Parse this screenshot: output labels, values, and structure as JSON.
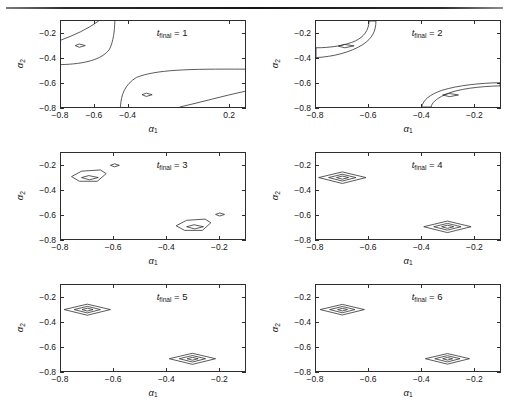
{
  "figure": {
    "kind": "contour-plot-grid",
    "rows": 3,
    "cols": 2,
    "background": "#ffffff",
    "line_color": "#2e2e2e",
    "rule_color": "#161616"
  },
  "axis": {
    "xlabel": "α",
    "xlabel_sub": "1",
    "ylabel": "α",
    "ylabel_sub": "2",
    "ylim": [
      -0.8,
      -0.1
    ],
    "yticks": [
      -0.2,
      -0.4,
      -0.6,
      -0.8
    ],
    "yticklabels": [
      "-0.2",
      "-0.4",
      "-0.6",
      "-0.8"
    ],
    "grid": false
  },
  "tag": {
    "symbol": "t",
    "subscript": "final",
    "equals": " = "
  },
  "chart_data": [
    {
      "type": "contour",
      "id": "panel-1",
      "title": "t_final = 1",
      "tag_value": "1",
      "xlabel": "α₁",
      "ylabel": "α₂",
      "xlim": [
        -0.8,
        0.3
      ],
      "ylim": [
        -0.8,
        -0.1
      ],
      "xticks": [
        -0.8,
        -0.6,
        -0.4,
        0.2
      ],
      "xticklabels": [
        "-0.8",
        "-0.6",
        "-0.4",
        "0.2"
      ],
      "yticks": [
        -0.2,
        -0.4,
        -0.6,
        -0.8
      ],
      "yticklabels": [
        "-0.2",
        "-0.4",
        "-0.6",
        "-0.8"
      ],
      "minima": [
        [
          -0.7,
          -0.3
        ],
        [
          -0.3,
          -0.7
        ]
      ],
      "description": "Two tiny closed diamond minima plus broad open contours sweeping across the panel; level sets are poorly localized.",
      "contour_paths": [
        "M -0.80 -0.255 C -0.72 -0.215 -0.64 -0.165 -0.575 -0.100",
        "M -0.80 -0.455 C -0.66 -0.450 -0.555 -0.415 -0.510 -0.330 C -0.486 -0.262 -0.480 -0.180 -0.478 -0.100",
        "M -0.445 -0.800 C -0.440 -0.700 -0.420 -0.620 -0.350 -0.560 C -0.230 -0.495 -0.040 -0.490 0.300 -0.492",
        "M -0.090 -0.800 C 0.040 -0.760 0.170 -0.710 0.300 -0.672",
        "M -0.715 -0.300 L -0.690 -0.287 L -0.655 -0.300 L -0.690 -0.314 Z",
        "M -0.315 -0.700 L -0.290 -0.687 L -0.255 -0.700 L -0.290 -0.714 Z"
      ]
    },
    {
      "type": "contour",
      "id": "panel-2",
      "title": "t_final = 2",
      "tag_value": "2",
      "xlabel": "α₁",
      "ylabel": "α₂",
      "xlim": [
        -0.8,
        -0.1
      ],
      "ylim": [
        -0.8,
        -0.1
      ],
      "xticks": [
        -0.8,
        -0.6,
        -0.4,
        -0.2
      ],
      "xticklabels": [
        "-0.8",
        "-0.6",
        "-0.4",
        "-0.2"
      ],
      "yticks": [
        -0.2,
        -0.4,
        -0.6,
        -0.8
      ],
      "yticklabels": [
        "-0.2",
        "-0.4",
        "-0.6",
        "-0.8"
      ],
      "minima": [
        [
          -0.7,
          -0.3
        ],
        [
          -0.3,
          -0.7
        ]
      ],
      "description": "Two elongated banana-shaped valleys running diagonally, each containing a small closed diamond minimum.",
      "contour_paths": [
        "M -0.800 -0.318 C -0.745 -0.318 -0.690 -0.300 -0.650 -0.262 C -0.618 -0.228 -0.600 -0.180 -0.598 -0.100 L -0.572 -0.100 C -0.572 -0.180 -0.585 -0.240 -0.622 -0.292 C -0.668 -0.355 -0.738 -0.392 -0.800 -0.398 Z",
        "M -0.715 -0.305 L -0.692 -0.291 L -0.655 -0.302 L -0.690 -0.318 Z",
        "M -0.398 -0.800 C -0.392 -0.742 -0.368 -0.700 -0.322 -0.665 C -0.258 -0.622 -0.170 -0.605 -0.100 -0.602 L -0.100 -0.628 C -0.176 -0.632 -0.262 -0.652 -0.310 -0.700 C -0.345 -0.735 -0.360 -0.770 -0.362 -0.800 Z",
        "M -0.318 -0.702 L -0.293 -0.690 L -0.258 -0.702 L -0.292 -0.716 Z"
      ]
    },
    {
      "type": "contour",
      "id": "panel-3",
      "title": "t_final = 3",
      "tag_value": "3",
      "xlabel": "α₁",
      "ylabel": "α₂",
      "xlim": [
        -0.8,
        -0.1
      ],
      "ylim": [
        -0.8,
        -0.1
      ],
      "xticks": [
        -0.8,
        -0.6,
        -0.4,
        -0.2
      ],
      "xticklabels": [
        "-0.8",
        "-0.6",
        "-0.4",
        "-0.2"
      ],
      "yticks": [
        -0.2,
        -0.4,
        -0.6,
        -0.8
      ],
      "yticklabels": [
        "-0.2",
        "-0.4",
        "-0.6",
        "-0.8"
      ],
      "minima": [
        [
          -0.7,
          -0.3
        ],
        [
          -0.3,
          -0.7
        ]
      ],
      "description": "Two compact pentagonal contours with inner diamond minima, plus two small detached diamond islands at (-0.6,-0.2) and (-0.2,-0.6).",
      "contour_paths": [
        "M -0.760 -0.292 L -0.722 -0.248 L -0.650 -0.238 L -0.628 -0.268 L -0.662 -0.330 L -0.730 -0.330 Z",
        "M -0.722 -0.300 L -0.694 -0.284 L -0.658 -0.300 L -0.692 -0.318 Z",
        "M -0.612 -0.200 L -0.596 -0.188 L -0.578 -0.200 L -0.596 -0.213 Z",
        "M -0.362 -0.692 L -0.322 -0.648 L -0.252 -0.638 L -0.230 -0.668 L -0.262 -0.730 L -0.330 -0.730 Z",
        "M -0.322 -0.700 L -0.294 -0.684 L -0.258 -0.700 L -0.292 -0.718 Z",
        "M -0.212 -0.600 L -0.196 -0.588 L -0.178 -0.600 L -0.196 -0.613 Z"
      ]
    },
    {
      "type": "contour",
      "id": "panel-4",
      "title": "t_final = 4",
      "tag_value": "4",
      "xlabel": "α₁",
      "ylabel": "α₂",
      "xlim": [
        -0.8,
        -0.1
      ],
      "ylim": [
        -0.8,
        -0.1
      ],
      "xticks": [
        -0.8,
        -0.6,
        -0.4,
        -0.2
      ],
      "xticklabels": [
        "-0.8",
        "-0.6",
        "-0.4",
        "-0.2"
      ],
      "yticks": [
        -0.2,
        -0.4,
        -0.6,
        -0.8
      ],
      "yticklabels": [
        "-0.2",
        "-0.4",
        "-0.6",
        "-0.8"
      ],
      "minima": [
        [
          -0.7,
          -0.3
        ],
        [
          -0.3,
          -0.7
        ]
      ],
      "description": "Two sets of nested, well-localized diamond level sets centred on the minima.",
      "contour_paths": [
        "M -0.790 -0.300 L -0.700 -0.254 L -0.610 -0.300 L -0.700 -0.348 Z",
        "M -0.752 -0.300 L -0.700 -0.273 L -0.648 -0.300 L -0.700 -0.328 Z",
        "M -0.722 -0.300 L -0.700 -0.288 L -0.676 -0.300 L -0.700 -0.313 Z",
        "M -0.390 -0.700 L -0.300 -0.654 L -0.210 -0.700 L -0.300 -0.748 Z",
        "M -0.352 -0.700 L -0.300 -0.673 L -0.248 -0.700 L -0.300 -0.728 Z",
        "M -0.322 -0.700 L -0.300 -0.688 L -0.276 -0.700 L -0.300 -0.713 Z"
      ]
    },
    {
      "type": "contour",
      "id": "panel-5",
      "title": "t_final = 5",
      "tag_value": "5",
      "xlabel": "α₁",
      "ylabel": "α₂",
      "xlim": [
        -0.8,
        -0.1
      ],
      "ylim": [
        -0.8,
        -0.1
      ],
      "xticks": [
        -0.8,
        -0.6,
        -0.4,
        -0.2
      ],
      "xticklabels": [
        "-0.8",
        "-0.6",
        "-0.4",
        "-0.2"
      ],
      "yticks": [
        -0.2,
        -0.4,
        -0.6,
        -0.8
      ],
      "yticklabels": [
        "-0.2",
        "-0.4",
        "-0.6",
        "-0.8"
      ],
      "minima": [
        [
          -0.7,
          -0.3
        ],
        [
          -0.3,
          -0.7
        ]
      ],
      "description": "Two sets of nested diamond level sets, slightly tighter than t_final = 4.",
      "contour_paths": [
        "M -0.788 -0.300 L -0.700 -0.256 L -0.612 -0.300 L -0.700 -0.346 Z",
        "M -0.750 -0.300 L -0.700 -0.274 L -0.650 -0.300 L -0.700 -0.327 Z",
        "M -0.720 -0.300 L -0.700 -0.289 L -0.678 -0.300 L -0.700 -0.312 Z",
        "M -0.388 -0.700 L -0.300 -0.656 L -0.212 -0.700 L -0.300 -0.746 Z",
        "M -0.350 -0.700 L -0.300 -0.674 L -0.250 -0.700 L -0.300 -0.727 Z",
        "M -0.320 -0.700 L -0.300 -0.689 L -0.278 -0.700 L -0.300 -0.712 Z"
      ]
    },
    {
      "type": "contour",
      "id": "panel-6",
      "title": "t_final = 6",
      "tag_value": "6",
      "xlabel": "α₁",
      "ylabel": "α₂",
      "xlim": [
        -0.8,
        -0.1
      ],
      "ylim": [
        -0.8,
        -0.1
      ],
      "xticks": [
        -0.8,
        -0.6,
        -0.4,
        -0.2
      ],
      "xticklabels": [
        "-0.8",
        "-0.6",
        "-0.4",
        "-0.2"
      ],
      "yticks": [
        -0.2,
        -0.4,
        -0.6,
        -0.8
      ],
      "yticklabels": [
        "-0.2",
        "-0.4",
        "-0.6",
        "-0.8"
      ],
      "minima": [
        [
          -0.7,
          -0.3
        ],
        [
          -0.3,
          -0.7
        ]
      ],
      "description": "Two sets of nested diamond level sets, the tightest localization of the series.",
      "contour_paths": [
        "M -0.784 -0.300 L -0.700 -0.258 L -0.616 -0.300 L -0.700 -0.344 Z",
        "M -0.748 -0.300 L -0.700 -0.275 L -0.652 -0.300 L -0.700 -0.326 Z",
        "M -0.718 -0.300 L -0.700 -0.290 L -0.680 -0.300 L -0.700 -0.311 Z",
        "M -0.384 -0.700 L -0.300 -0.658 L -0.216 -0.700 L -0.300 -0.744 Z",
        "M -0.348 -0.700 L -0.300 -0.675 L -0.252 -0.700 L -0.300 -0.726 Z",
        "M -0.318 -0.700 L -0.300 -0.690 L -0.280 -0.700 L -0.300 -0.711 Z"
      ]
    }
  ]
}
